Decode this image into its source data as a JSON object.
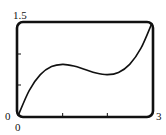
{
  "chart_data": {
    "type": "line",
    "title": "",
    "xlabel": "",
    "ylabel": "",
    "xlim": [
      0,
      3
    ],
    "ylim": [
      0,
      1.5
    ],
    "grid": false,
    "legend": null,
    "tick_labels": {
      "x": [
        "0",
        "3"
      ],
      "y": [
        "0",
        "1.5"
      ]
    },
    "x_ticks": [
      1,
      2
    ],
    "y_ticks": [
      0.5,
      1.0
    ],
    "series": [
      {
        "name": "f(x)",
        "x": [
          0,
          0.25,
          0.5,
          0.75,
          1.0,
          1.25,
          1.5,
          1.75,
          2.0,
          2.25,
          2.5,
          2.75,
          3.0
        ],
        "values": [
          0,
          0.411,
          0.667,
          0.797,
          0.833,
          0.807,
          0.75,
          0.693,
          0.667,
          0.703,
          0.833,
          1.089,
          1.5
        ]
      }
    ],
    "colors": {
      "line": "#111111",
      "frame": "#111111"
    }
  },
  "labels": {
    "y_max": "1.5",
    "y_min": "0",
    "x_min": "0",
    "x_max": "3"
  }
}
